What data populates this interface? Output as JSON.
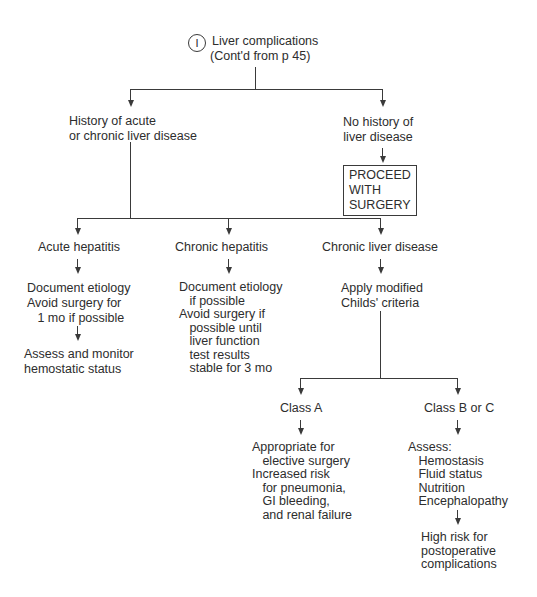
{
  "header": {
    "badge": "I",
    "title": "Liver complications",
    "subtitle": "(Cont'd from p 45)"
  },
  "level1": {
    "history": "History of acute\nor chronic liver disease",
    "no_history": "No history of\nliver disease",
    "proceed_box": "PROCEED\nWITH\nSURGERY"
  },
  "level2": {
    "acute_hepatitis": {
      "label": "Acute hepatitis",
      "step1": "Document etiology\nAvoid surgery for\n   1 mo if possible",
      "step2": "Assess and monitor\nhemostatic status"
    },
    "chronic_hepatitis": {
      "label": "Chronic hepatitis",
      "step1": "Document etiology\n   if possible\nAvoid surgery if\n   possible until\n   liver function\n   test results\n   stable for 3 mo"
    },
    "chronic_liver_disease": {
      "label": "Chronic liver disease",
      "step1": "Apply modified\nChilds' criteria"
    }
  },
  "level3": {
    "class_a": {
      "label": "Class A",
      "step1": "Appropriate for\n   elective surgery\nIncreased risk\n   for pneumonia,\n   GI bleeding,\n   and renal failure"
    },
    "class_bc": {
      "label": "Class B or C",
      "step1": "Assess:\n   Hemostasis\n   Fluid status\n   Nutrition\n   Encephalopathy",
      "step2": "High risk for\npostoperative\ncomplications"
    }
  }
}
